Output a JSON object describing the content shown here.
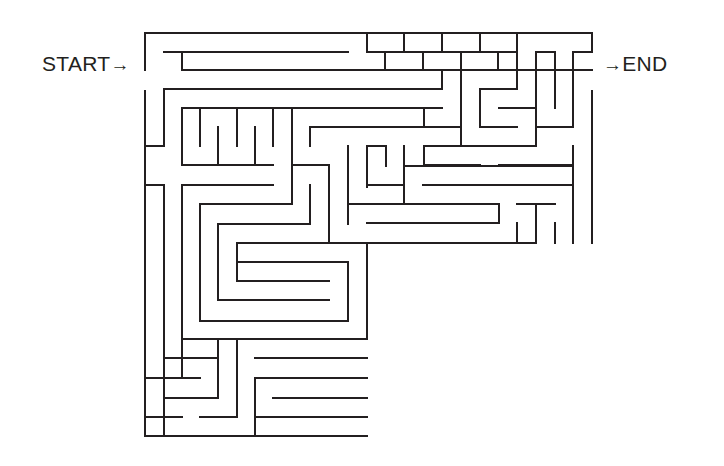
{
  "labels": {
    "start": "START",
    "end": "END",
    "arrow": "→"
  },
  "style": {
    "wall_color": "#231f20",
    "background": "#ffffff"
  },
  "maze": {
    "walls": [
      [
        145,
        33,
        592,
        33
      ],
      [
        592,
        33,
        592,
        52
      ],
      [
        573,
        52,
        592,
        52
      ],
      [
        145,
        33,
        145,
        70
      ],
      [
        145,
        91,
        145,
        436
      ],
      [
        164,
        52,
        348,
        52
      ],
      [
        367,
        52,
        517,
        52
      ],
      [
        182,
        52,
        182,
        70
      ],
      [
        182,
        70,
        592,
        70
      ],
      [
        367,
        33,
        367,
        52
      ],
      [
        404,
        33,
        404,
        52
      ],
      [
        442,
        33,
        442,
        52
      ],
      [
        480,
        33,
        480,
        52
      ],
      [
        385,
        52,
        385,
        70
      ],
      [
        423,
        52,
        423,
        70
      ],
      [
        461,
        52,
        461,
        70
      ],
      [
        498,
        52,
        498,
        70
      ],
      [
        517,
        33,
        517,
        89
      ],
      [
        536,
        52,
        555,
        52
      ],
      [
        536,
        52,
        536,
        108
      ],
      [
        555,
        52,
        555,
        108
      ],
      [
        573,
        52,
        573,
        127
      ],
      [
        536,
        127,
        573,
        127
      ],
      [
        536,
        108,
        536,
        146
      ],
      [
        164,
        89,
        442,
        89
      ],
      [
        164,
        89,
        164,
        146
      ],
      [
        145,
        146,
        164,
        146
      ],
      [
        442,
        70,
        442,
        89
      ],
      [
        461,
        70,
        461,
        146
      ],
      [
        480,
        89,
        517,
        89
      ],
      [
        480,
        89,
        480,
        127
      ],
      [
        480,
        127,
        517,
        127
      ],
      [
        182,
        108,
        442,
        108
      ],
      [
        182,
        108,
        182,
        165
      ],
      [
        218,
        127,
        218,
        165
      ],
      [
        255,
        127,
        255,
        165
      ],
      [
        200,
        108,
        200,
        146
      ],
      [
        237,
        108,
        237,
        146
      ],
      [
        273,
        108,
        273,
        146
      ],
      [
        292,
        108,
        292,
        204
      ],
      [
        182,
        165,
        273,
        165
      ],
      [
        310,
        127,
        442,
        127
      ],
      [
        310,
        127,
        310,
        146
      ],
      [
        424,
        108,
        424,
        127
      ],
      [
        424,
        127,
        461,
        127
      ],
      [
        499,
        108,
        536,
        108
      ],
      [
        424,
        146,
        536,
        146
      ],
      [
        424,
        146,
        424,
        165
      ],
      [
        424,
        165,
        480,
        165
      ],
      [
        499,
        165,
        573,
        165
      ],
      [
        573,
        146,
        573,
        243
      ],
      [
        592,
        91,
        592,
        243
      ],
      [
        292,
        127,
        292,
        127
      ],
      [
        145,
        185,
        164,
        185
      ],
      [
        164,
        185,
        164,
        436
      ],
      [
        182,
        185,
        273,
        185
      ],
      [
        182,
        185,
        182,
        378
      ],
      [
        292,
        165,
        329,
        165
      ],
      [
        329,
        165,
        329,
        243
      ],
      [
        348,
        146,
        348,
        224
      ],
      [
        367,
        146,
        386,
        146
      ],
      [
        367,
        146,
        367,
        187
      ],
      [
        386,
        146,
        386,
        166
      ],
      [
        367,
        185,
        404,
        185
      ],
      [
        404,
        146,
        404,
        204
      ],
      [
        404,
        166,
        573,
        166
      ],
      [
        423,
        185,
        573,
        185
      ],
      [
        348,
        204,
        499,
        204
      ],
      [
        499,
        204,
        499,
        223
      ],
      [
        367,
        223,
        499,
        223
      ],
      [
        517,
        204,
        555,
        204
      ],
      [
        536,
        204,
        536,
        243
      ],
      [
        517,
        223,
        517,
        243
      ],
      [
        555,
        223,
        555,
        243
      ],
      [
        330,
        243,
        536,
        243
      ],
      [
        310,
        185,
        310,
        224
      ],
      [
        200,
        204,
        292,
        204
      ],
      [
        200,
        204,
        200,
        321
      ],
      [
        218,
        224,
        310,
        224
      ],
      [
        218,
        224,
        218,
        300
      ],
      [
        237,
        243,
        329,
        243
      ],
      [
        237,
        243,
        237,
        281
      ],
      [
        348,
        262,
        348,
        300
      ],
      [
        237,
        262,
        348,
        262
      ],
      [
        237,
        262,
        237,
        281
      ],
      [
        237,
        281,
        329,
        281
      ],
      [
        218,
        300,
        329,
        300
      ],
      [
        200,
        321,
        348,
        321
      ],
      [
        348,
        262,
        348,
        321
      ],
      [
        182,
        339,
        367,
        339
      ],
      [
        367,
        243,
        367,
        339
      ],
      [
        164,
        358,
        218,
        358
      ],
      [
        218,
        339,
        218,
        398
      ],
      [
        237,
        339,
        237,
        417
      ],
      [
        255,
        358,
        367,
        358
      ],
      [
        255,
        378,
        367,
        378
      ],
      [
        255,
        378,
        255,
        436
      ],
      [
        145,
        378,
        200,
        378
      ],
      [
        164,
        398,
        218,
        398
      ],
      [
        273,
        398,
        367,
        398
      ],
      [
        145,
        417,
        182,
        417
      ],
      [
        200,
        417,
        237,
        417
      ],
      [
        255,
        417,
        367,
        417
      ],
      [
        145,
        436,
        367,
        436
      ]
    ]
  }
}
